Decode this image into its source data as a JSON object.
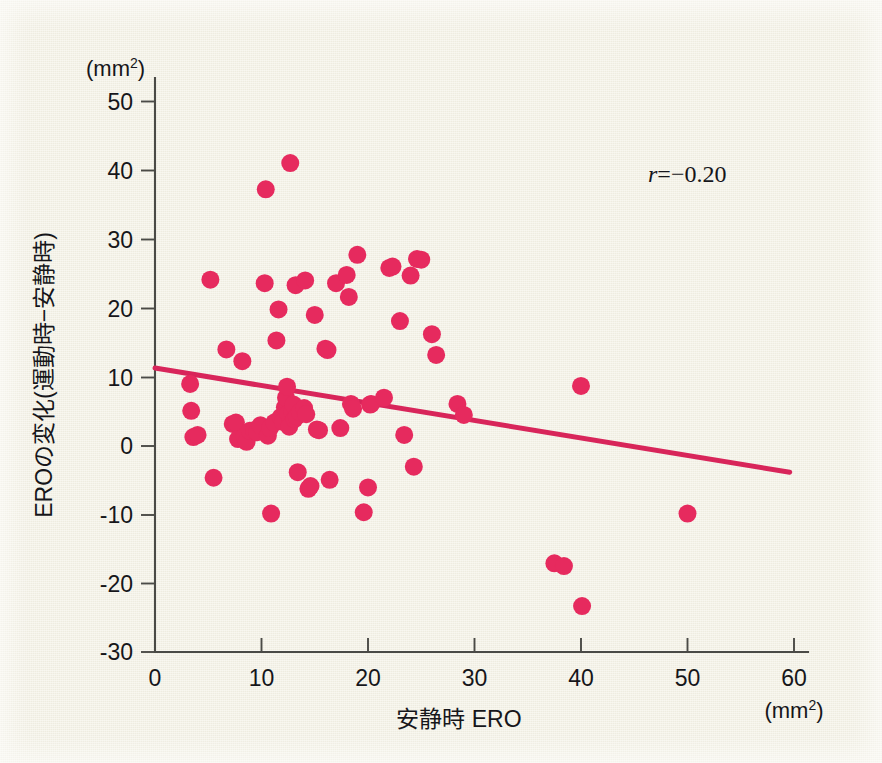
{
  "figure": {
    "background_color": "#f4f2e6",
    "point_color": "#e62a5e",
    "line_color": "#d8255a",
    "axis_color": "#4a4a46"
  },
  "chart_data": {
    "type": "scatter",
    "title": "",
    "subtitle": "",
    "xlabel": "安静時 ERO",
    "ylabel": "EROの変化(運動時−安静時)",
    "x_unit_label": "(mm2)",
    "y_unit_label": "(mm2)",
    "x_unit_base": "(mm",
    "x_unit_exp": "2",
    "x_unit_close": ")",
    "y_unit_base": "(mm",
    "y_unit_exp": "2",
    "y_unit_close": ")",
    "xlim": [
      0,
      60
    ],
    "ylim": [
      -30,
      50
    ],
    "xticks": [
      0,
      10,
      20,
      30,
      40,
      50,
      60
    ],
    "yticks": [
      -30,
      -20,
      -10,
      0,
      10,
      20,
      30,
      40,
      50
    ],
    "grid": false,
    "legend": null,
    "annotations": [
      {
        "name": "correlation-coefficient",
        "symbol": "r",
        "text": "=−0.20",
        "full_text": "r=−0.20",
        "x": 44.5,
        "y": 41.5
      }
    ],
    "trendline": {
      "name": "regression-line",
      "x_start": 0.0,
      "y_start": 11.3,
      "x_end": 59.6,
      "y_end": -3.8,
      "slope": -0.2534,
      "intercept": 11.3
    },
    "marker_radius_px": 9,
    "n_points": 77,
    "points": [
      [
        3.3,
        9.0
      ],
      [
        3.4,
        5.1
      ],
      [
        3.6,
        1.3
      ],
      [
        4.0,
        1.6
      ],
      [
        5.2,
        24.1
      ],
      [
        5.5,
        -4.6
      ],
      [
        6.7,
        14.0
      ],
      [
        7.3,
        3.2
      ],
      [
        7.6,
        3.4
      ],
      [
        7.8,
        1.0
      ],
      [
        8.2,
        12.3
      ],
      [
        8.4,
        1.4
      ],
      [
        8.6,
        0.6
      ],
      [
        8.9,
        2.2
      ],
      [
        9.3,
        2.3
      ],
      [
        9.6,
        2.0
      ],
      [
        9.9,
        3.0
      ],
      [
        10.3,
        23.6
      ],
      [
        10.4,
        37.2
      ],
      [
        10.6,
        1.5
      ],
      [
        10.8,
        2.6
      ],
      [
        10.9,
        -9.8
      ],
      [
        11.2,
        3.4
      ],
      [
        11.4,
        15.3
      ],
      [
        11.6,
        19.8
      ],
      [
        11.8,
        4.2
      ],
      [
        12.0,
        3.5
      ],
      [
        12.2,
        5.6
      ],
      [
        12.3,
        7.0
      ],
      [
        12.4,
        8.6
      ],
      [
        12.5,
        4.7
      ],
      [
        12.6,
        2.8
      ],
      [
        12.7,
        41.0
      ],
      [
        12.9,
        5.0
      ],
      [
        13.0,
        6.0
      ],
      [
        13.1,
        3.9
      ],
      [
        13.2,
        23.3
      ],
      [
        13.3,
        4.3
      ],
      [
        13.4,
        -3.8
      ],
      [
        13.6,
        4.9
      ],
      [
        14.0,
        5.5
      ],
      [
        14.1,
        24.0
      ],
      [
        14.2,
        4.6
      ],
      [
        14.4,
        -6.2
      ],
      [
        14.6,
        -5.8
      ],
      [
        15.0,
        19.0
      ],
      [
        15.2,
        2.4
      ],
      [
        15.4,
        2.3
      ],
      [
        16.0,
        14.1
      ],
      [
        16.2,
        13.9
      ],
      [
        16.4,
        -4.9
      ],
      [
        17.0,
        23.6
      ],
      [
        17.4,
        2.6
      ],
      [
        18.0,
        24.8
      ],
      [
        18.2,
        21.6
      ],
      [
        18.4,
        6.1
      ],
      [
        18.6,
        5.4
      ],
      [
        19.0,
        27.7
      ],
      [
        19.6,
        -9.6
      ],
      [
        20.0,
        -6.0
      ],
      [
        20.2,
        6.0
      ],
      [
        20.3,
        6.1
      ],
      [
        21.5,
        7.0
      ],
      [
        22.0,
        25.8
      ],
      [
        22.3,
        26.0
      ],
      [
        23.0,
        18.1
      ],
      [
        23.4,
        1.6
      ],
      [
        24.0,
        24.7
      ],
      [
        24.3,
        -3.0
      ],
      [
        24.6,
        27.1
      ],
      [
        25.0,
        27.0
      ],
      [
        26.0,
        16.2
      ],
      [
        26.4,
        13.2
      ],
      [
        28.4,
        6.1
      ],
      [
        29.0,
        4.5
      ],
      [
        37.5,
        -17.0
      ],
      [
        38.4,
        -17.4
      ],
      [
        40.0,
        8.7
      ],
      [
        40.1,
        -23.2
      ],
      [
        50.0,
        -9.8
      ]
    ]
  },
  "plot_geometry": {
    "left_px": 155,
    "right_px": 806,
    "bottom_px": 652,
    "top_px": 82,
    "x0_px": 155,
    "y0_px": 446,
    "px_per_x_unit": 10.65,
    "px_per_y_unit": 6.9
  }
}
